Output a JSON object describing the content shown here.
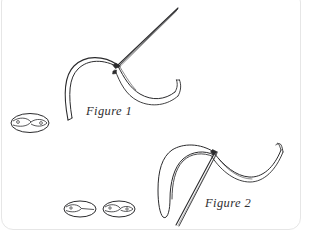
{
  "document": {
    "type": "line-drawing",
    "title": "Suture needle and thread illustrations",
    "background_color": "#ffffff",
    "ink_color": "#2b2b2d",
    "border_color": "#e6e6e6"
  },
  "figures": [
    {
      "id": "figure-1",
      "label": "Figure 1",
      "description": "Curved suture needle with straight shaft and ribbon thread",
      "label_x": 86,
      "label_y": 104
    },
    {
      "id": "figure-2",
      "label": "Figure 2",
      "description": "Needle passing through a thread loop with ribbon thread extending right",
      "label_x": 205,
      "label_y": 196
    }
  ],
  "detail_glyphs": [
    {
      "id": "cross-section-1",
      "cx": 30,
      "cy": 123,
      "rx": 19,
      "ry": 9.5
    },
    {
      "id": "cross-section-2",
      "cx": 80,
      "cy": 209,
      "rx": 16,
      "ry": 8
    },
    {
      "id": "cross-section-3",
      "cx": 119,
      "cy": 209,
      "rx": 16,
      "ry": 8
    }
  ]
}
